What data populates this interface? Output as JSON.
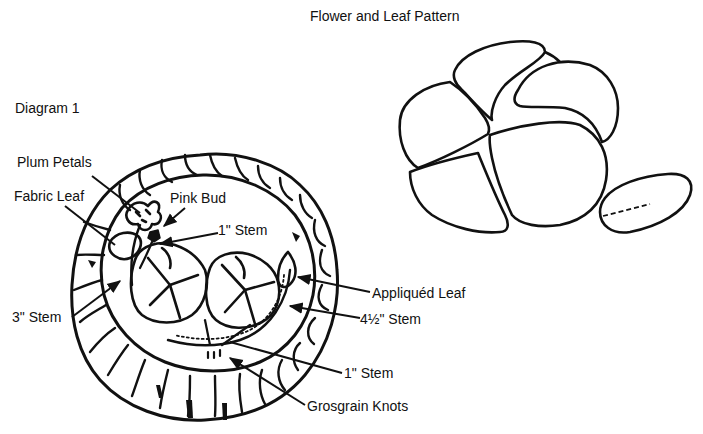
{
  "titles": {
    "pattern_title": "Flower and Leaf Pattern",
    "diagram_title": "Diagram 1"
  },
  "labels": {
    "plum_petals": "Plum Petals",
    "fabric_leaf": "Fabric Leaf",
    "pink_bud": "Pink Bud",
    "stem_1_top": "1\" Stem",
    "stem_3": "3\" Stem",
    "appliqued_leaf": "Appliquéd Leaf",
    "stem_4_5": "4½\" Stem",
    "stem_1_bottom": "1\" Stem",
    "grosgrain_knots": "Grosgrain Knots"
  },
  "colors": {
    "ink": "#111111",
    "background": "#ffffff"
  }
}
